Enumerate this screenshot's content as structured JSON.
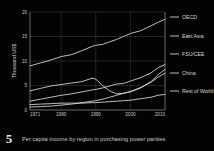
{
  "figure": {
    "number": "5",
    "caption": "Per capita income by region in purchasing power parities"
  },
  "colors": {
    "background": "#030303",
    "line": "#dcdcdc",
    "grid": "#4a4a4a",
    "axis": "#9a9a9a",
    "text": "#c7c7c7"
  },
  "chart_data": {
    "type": "line",
    "title": "",
    "subtitle": "",
    "xlabel": "",
    "ylabel": "Thousand US$",
    "xlim": [
      1971,
      2010
    ],
    "ylim": [
      0,
      20
    ],
    "grid": true,
    "legend_position": "right",
    "xticks": [
      "1971",
      "1980",
      "1990",
      "2000",
      "2010"
    ],
    "xtick_values": [
      1971,
      1980,
      1990,
      2000,
      2010
    ],
    "yticks": [
      "0",
      "5",
      "10",
      "15",
      "20"
    ],
    "ytick_values": [
      0,
      5,
      10,
      15,
      20
    ],
    "x": [
      1971,
      1974,
      1977,
      1980,
      1983,
      1986,
      1989,
      1990,
      1992,
      1994,
      1996,
      1998,
      2000,
      2003,
      2006,
      2008,
      2010
    ],
    "series": [
      {
        "name": "OECD",
        "values": [
          9.0,
          9.6,
          10.2,
          10.9,
          11.3,
          12.1,
          13.0,
          13.2,
          13.4,
          13.9,
          14.4,
          15.0,
          15.6,
          16.2,
          17.2,
          17.9,
          18.5
        ]
      },
      {
        "name": "East Asia",
        "values": [
          1.8,
          2.2,
          2.6,
          3.0,
          3.3,
          3.7,
          4.1,
          4.2,
          4.5,
          4.9,
          5.3,
          5.4,
          5.9,
          6.6,
          7.6,
          8.6,
          9.3
        ]
      },
      {
        "name": "FSU/CEE",
        "values": [
          3.9,
          4.4,
          4.9,
          5.2,
          5.5,
          5.8,
          6.5,
          6.3,
          5.0,
          3.9,
          3.3,
          3.4,
          3.7,
          4.5,
          5.8,
          7.2,
          8.3
        ]
      },
      {
        "name": "China",
        "values": [
          0.6,
          0.7,
          0.8,
          1.0,
          1.2,
          1.5,
          1.8,
          1.9,
          2.2,
          2.6,
          3.0,
          3.4,
          3.8,
          4.6,
          5.7,
          6.7,
          7.5
        ]
      },
      {
        "name": "Rest of World",
        "values": [
          1.1,
          1.2,
          1.3,
          1.4,
          1.4,
          1.4,
          1.5,
          1.5,
          1.6,
          1.7,
          1.8,
          1.9,
          2.0,
          2.3,
          2.6,
          3.0,
          3.2
        ]
      }
    ]
  },
  "legend": {
    "items": [
      {
        "label": "OECD"
      },
      {
        "label": "East Asia"
      },
      {
        "label": "FSU/CEE"
      },
      {
        "label": "China"
      },
      {
        "label": "Rest of World"
      }
    ]
  }
}
